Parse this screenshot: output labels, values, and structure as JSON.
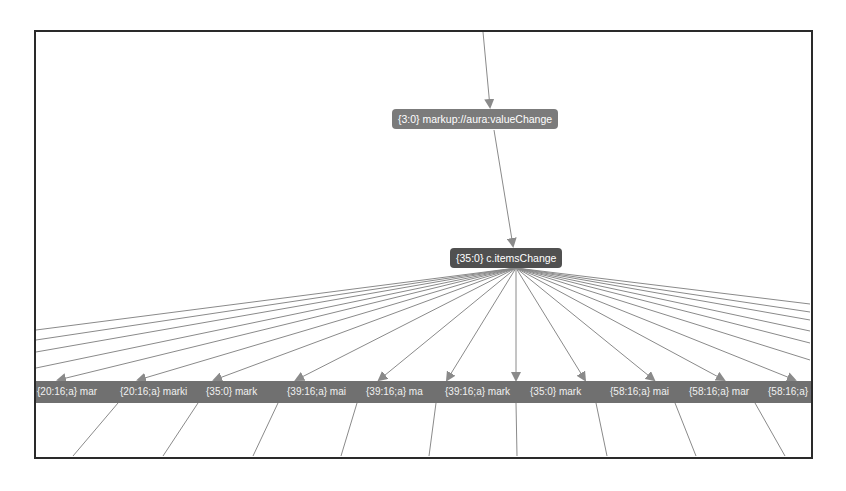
{
  "graph": {
    "colors": {
      "frame_border": "#2a2a2a",
      "edge": "#8a8a8a",
      "node_top_bg": "#7b7b7b",
      "node_center_bg": "#505050",
      "child_bar_bg": "#707070",
      "node_text": "#ffffff"
    },
    "nodes": {
      "top": {
        "label": "{3:0} markup://aura:valueChange"
      },
      "center": {
        "label": "{35:0} c.itemsChange"
      }
    },
    "children": [
      {
        "label": "{20:16;a} mar",
        "width": 83
      },
      {
        "label": "{20:16;a} marki",
        "width": 86
      },
      {
        "label": "{35:0} mark",
        "width": 81
      },
      {
        "label": "{39:16;a} mai",
        "width": 79
      },
      {
        "label": "{39:16;a} ma",
        "width": 79
      },
      {
        "label": "{39:16;a} mark",
        "width": 85
      },
      {
        "label": "{35:0} mark",
        "width": 80
      },
      {
        "label": "{58:16;a} mai",
        "width": 79
      },
      {
        "label": "{58:16;a} mar",
        "width": 79
      },
      {
        "label": "{58:16;a} mar",
        "width": 80
      }
    ]
  }
}
